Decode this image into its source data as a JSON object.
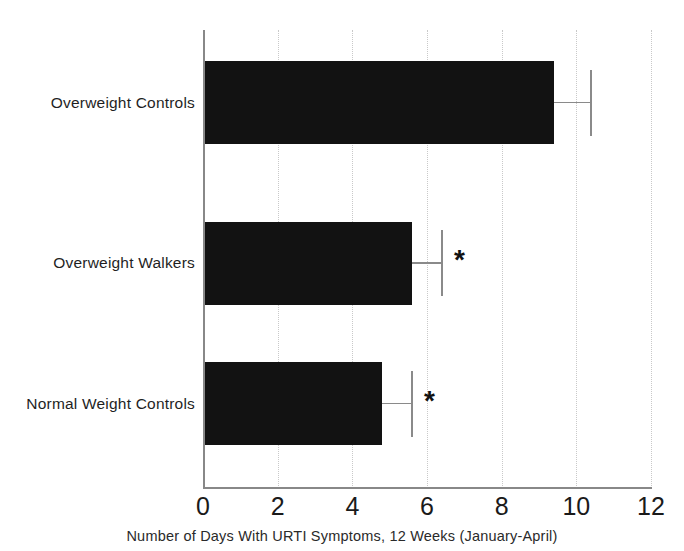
{
  "chart_data": {
    "type": "bar",
    "orientation": "horizontal",
    "title": "",
    "subtitle": "",
    "xlabel": "Number of Days With URTI Symptoms, 12 Weeks (January-April)",
    "ylabel": "",
    "categories": [
      "Overweight Controls",
      "Overweight Walkers",
      "Normal Weight Controls"
    ],
    "values": [
      9.4,
      5.6,
      4.8
    ],
    "errors_upper": [
      1.0,
      0.8,
      0.8
    ],
    "annotations": [
      "",
      "*",
      "*"
    ],
    "xlim": [
      0,
      12
    ],
    "xticks": [
      0,
      2,
      4,
      6,
      8,
      10,
      12
    ],
    "xtick_labels": [
      "0",
      "2",
      "4",
      "6",
      "8",
      "10",
      "12"
    ],
    "gridlines_x": [
      2,
      4,
      6,
      8,
      10,
      12
    ],
    "grid": true,
    "legend": "none",
    "bar_color": "#121212",
    "error_color": "#8a8a8a",
    "grid_color": "#c9c9c9",
    "axis_color": "#888888",
    "series": [
      {
        "name": "Days with URTI symptoms",
        "points": [
          {
            "category": "Overweight Controls",
            "value": 9.4,
            "error_upper": 1.0,
            "significance": ""
          },
          {
            "category": "Overweight Walkers",
            "value": 5.6,
            "error_upper": 0.8,
            "significance": "*"
          },
          {
            "category": "Normal Weight Controls",
            "value": 4.8,
            "error_upper": 0.8,
            "significance": "*"
          }
        ]
      }
    ]
  }
}
